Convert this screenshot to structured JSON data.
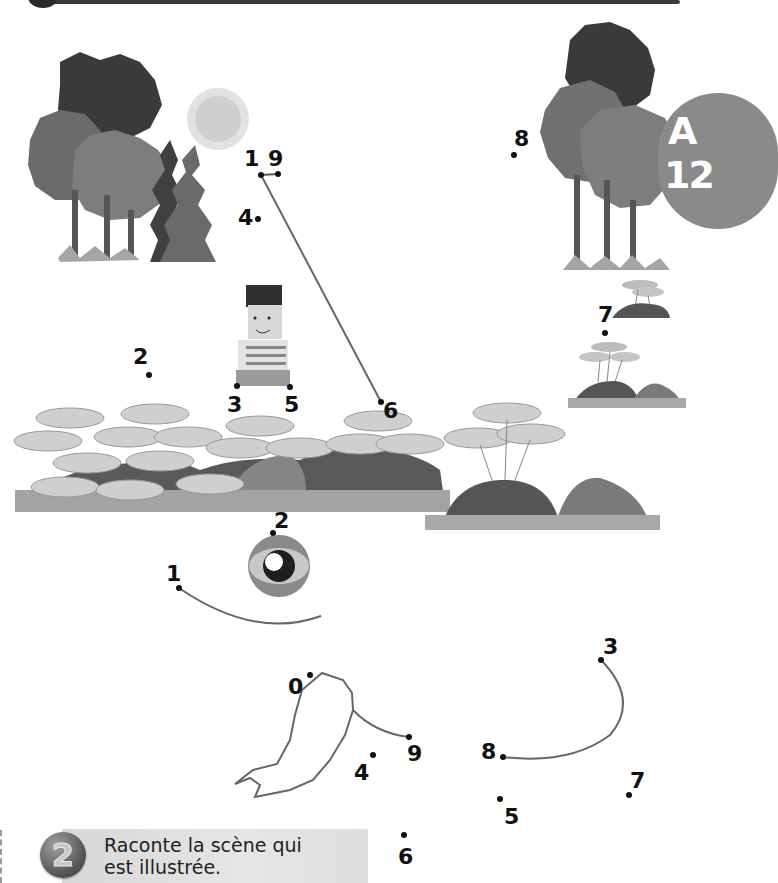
{
  "page": {
    "badge": {
      "letter": "A",
      "number": "12",
      "color": "#8a8a8a"
    },
    "colors": {
      "line": "#6e6e6e",
      "dot": "#111111",
      "text": "#111111"
    }
  },
  "puzzle_top": {
    "labels": [
      {
        "text": "1",
        "x": 244,
        "y": 148
      },
      {
        "text": "9",
        "x": 268,
        "y": 148
      },
      {
        "text": "4",
        "x": 238,
        "y": 207
      },
      {
        "text": "8",
        "x": 514,
        "y": 128
      },
      {
        "text": "7",
        "x": 598,
        "y": 304
      },
      {
        "text": "2",
        "x": 133,
        "y": 346
      },
      {
        "text": "3",
        "x": 227,
        "y": 394
      },
      {
        "text": "5",
        "x": 284,
        "y": 394
      },
      {
        "text": "6",
        "x": 383,
        "y": 400
      }
    ],
    "dots": [
      {
        "name": "dot-1",
        "x": 261,
        "y": 175
      },
      {
        "name": "dot-9",
        "x": 278,
        "y": 174
      },
      {
        "name": "dot-4",
        "x": 258,
        "y": 219
      },
      {
        "name": "dot-8",
        "x": 514,
        "y": 155
      },
      {
        "name": "dot-7",
        "x": 605,
        "y": 333
      },
      {
        "name": "dot-2",
        "x": 149,
        "y": 375
      },
      {
        "name": "dot-3",
        "x": 237,
        "y": 386
      },
      {
        "name": "dot-5",
        "x": 290,
        "y": 387
      },
      {
        "name": "dot-6",
        "x": 381,
        "y": 402
      }
    ]
  },
  "puzzle_bottom": {
    "labels": [
      {
        "text": "1",
        "x": 166,
        "y": 563
      },
      {
        "text": "2",
        "x": 274,
        "y": 510
      },
      {
        "text": "0",
        "x": 288,
        "y": 676
      },
      {
        "text": "9",
        "x": 407,
        "y": 743
      },
      {
        "text": "4",
        "x": 354,
        "y": 762
      },
      {
        "text": "8",
        "x": 481,
        "y": 741
      },
      {
        "text": "3",
        "x": 603,
        "y": 636
      },
      {
        "text": "7",
        "x": 630,
        "y": 770
      },
      {
        "text": "5",
        "x": 504,
        "y": 806
      },
      {
        "text": "6",
        "x": 398,
        "y": 846
      }
    ],
    "dots": [
      {
        "name": "dot-1",
        "x": 179,
        "y": 588
      },
      {
        "name": "dot-2",
        "x": 273,
        "y": 533
      },
      {
        "name": "dot-0",
        "x": 310,
        "y": 675
      },
      {
        "name": "dot-9",
        "x": 409,
        "y": 737
      },
      {
        "name": "dot-4",
        "x": 373,
        "y": 755
      },
      {
        "name": "dot-8",
        "x": 503,
        "y": 757
      },
      {
        "name": "dot-3",
        "x": 601,
        "y": 660
      },
      {
        "name": "dot-7",
        "x": 629,
        "y": 795
      },
      {
        "name": "dot-5",
        "x": 500,
        "y": 799
      },
      {
        "name": "dot-6",
        "x": 404,
        "y": 835
      }
    ]
  },
  "instruction": {
    "number": "2",
    "line1": "Raconte la scène qui",
    "line2": "est illustrée."
  }
}
